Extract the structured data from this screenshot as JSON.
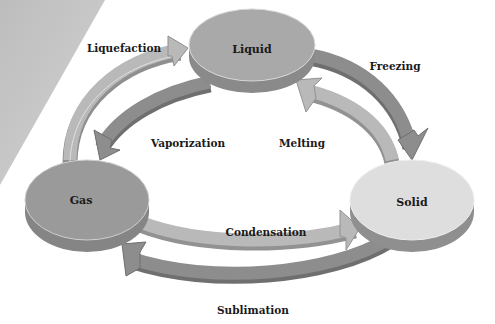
{
  "diagram": {
    "type": "phase-transition-cycle",
    "nodes": [
      {
        "id": "liquid",
        "label": "Liquid",
        "color": "#a9a9a9"
      },
      {
        "id": "gas",
        "label": "Gas",
        "color": "#9a9a9a"
      },
      {
        "id": "solid",
        "label": "Solid",
        "color": "#dedede"
      }
    ],
    "transitions": [
      {
        "id": "liquefaction",
        "label": "Liquefaction",
        "from": "gas",
        "to": "liquid"
      },
      {
        "id": "vaporization",
        "label": "Vaporization",
        "from": "liquid",
        "to": "gas"
      },
      {
        "id": "freezing",
        "label": "Freezing",
        "from": "liquid",
        "to": "solid"
      },
      {
        "id": "melting",
        "label": "Melting",
        "from": "solid",
        "to": "liquid"
      },
      {
        "id": "condensation",
        "label": "Condensation",
        "from": "gas",
        "to": "solid"
      },
      {
        "id": "sublimation",
        "label": "Sublimation",
        "from": "solid",
        "to": "gas"
      }
    ],
    "colors": {
      "background": "#ffffff",
      "corner_band": "#c8c8c8",
      "arrow_light": "#b4b4b4",
      "arrow_dark": "#8c8c8c",
      "disc_side": "#8a8a8a"
    }
  }
}
